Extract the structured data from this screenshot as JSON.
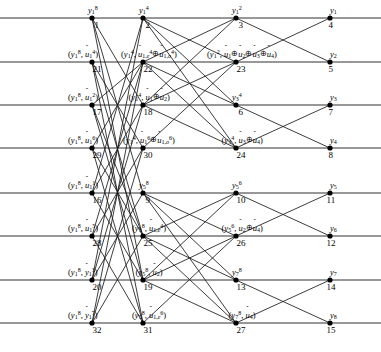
{
  "figure": {
    "kind": "polar-code decoding factor graph / butterfly trellis",
    "columns": 4,
    "rows": 8,
    "node_count": 32,
    "colors": {
      "line": "#1a1a1a",
      "node": "#000000",
      "background": "#ffffff"
    },
    "symbols": {
      "xor": "⊕",
      "hat": "ˆ"
    }
  },
  "layout": {
    "col_x": [
      92,
      143,
      236,
      330
    ],
    "row_y": [
      18,
      62,
      105,
      148,
      193,
      236,
      280,
      323
    ],
    "node_radius": 2.6
  },
  "nodes": [
    {
      "id": 1,
      "num": "1",
      "col": 0,
      "row": 0,
      "label_html": "<i>y</i><sub>1</sub><sup>8</sup>",
      "label_pos": "above",
      "label_text": "y_1^8"
    },
    {
      "id": 21,
      "num": "21",
      "col": 0,
      "row": 1,
      "label_html": "(<i>y</i><sub>1</sub><sup>8</sup>, <span class=\"hat\"><span class=\"h\">ˆ</span><i>u</i></span><sub>1</sub><sup>4</sup>)",
      "label_pos": "above",
      "label_text": "(y_1^8, û1^4)"
    },
    {
      "id": 17,
      "num": "17",
      "col": 0,
      "row": 2,
      "label_html": "(<i>y</i><sub>1</sub><sup>8</sup>, <span class=\"hat\"><span class=\"h\">ˆ</span><i>u</i></span><sub>1</sub><sup>2</sup>)",
      "label_pos": "above",
      "label_text": "(y_1^8, û1^2)"
    },
    {
      "id": 29,
      "num": "29",
      "col": 0,
      "row": 3,
      "label_html": "(<i>y</i><sub>1</sub><sup>8</sup>, <span class=\"hat\"><span class=\"h\">ˆ</span><i>u</i></span><sub>1</sub><sup>6</sup>)",
      "label_pos": "above",
      "label_text": "(y_1^8, û1^6)"
    },
    {
      "id": 16,
      "num": "16",
      "col": 0,
      "row": 4,
      "label_html": "(<i>y</i><sub>1</sub><sup>8</sup>, <span class=\"hat\"><span class=\"h\">ˆ</span><i>u</i></span><sub>1</sub><sup>1</sup>)",
      "label_pos": "above",
      "label_text": "(y_1^8, û1^1)"
    },
    {
      "id": 28,
      "num": "28",
      "col": 0,
      "row": 5,
      "label_html": "(<i>y</i><sub>1</sub><sup>8</sup>, <span class=\"hat\"><span class=\"h\">ˆ</span><i>u</i></span><sub>1</sub><sup>5</sup>)",
      "label_pos": "above",
      "label_text": "(y_1^8, û1^5)"
    },
    {
      "id": 20,
      "num": "20",
      "col": 0,
      "row": 6,
      "label_html": "(<i>y</i><sub>1</sub><sup>8</sup>, <span class=\"hat\"><span class=\"h\">ˆ</span><i>y</i></span><sub>1</sub><sup>3</sup>)",
      "label_pos": "above",
      "label_text": "(y_1^8, ŷ1^3)"
    },
    {
      "id": 32,
      "num": "32",
      "col": 0,
      "row": 7,
      "label_html": "(<i>y</i><sub>1</sub><sup>8</sup>, <span class=\"hat\"><span class=\"h\">ˆ</span><i>y</i></span><sub>1</sub><sup>7</sup>)",
      "label_pos": "above",
      "label_text": "(y_1^8, ŷ1^7)"
    },
    {
      "id": 2,
      "num": "2",
      "col": 1,
      "row": 0,
      "label_html": "<i>y</i><sub>1</sub><sup>4</sup>",
      "label_pos": "above",
      "label_text": "y_1^4"
    },
    {
      "id": 22,
      "num": "22",
      "col": 1,
      "row": 1,
      "label_html": "(<i>y</i><sub>1</sub><sup>4</sup>, <span class=\"hat\"><span class=\"h\">ˆ</span><i>u</i></span><sub>1,<i>e</i></sub><sup>4</sup><span class=\"xor\">⊕</span><span class=\"hat\"><span class=\"h\">ˆ</span><i>u</i></span><sub>1,<i>o</i></sub><sup>4</sup>)",
      "label_pos": "above",
      "label_text": "(y_1^4, û1,e^4 ⊕ û1,o^4)"
    },
    {
      "id": 18,
      "num": "18",
      "col": 1,
      "row": 2,
      "label_html": "(<i>y</i><sub>1</sub><sup>4</sup>, <span class=\"hat\"><span class=\"h\">ˆ</span><i>u</i></span><sub>1</sub><span class=\"xor\">⊕</span><span class=\"hat\"><span class=\"h\">ˆ</span><i>u</i></span><sub>2</sub>)",
      "label_pos": "above",
      "label_text": "(y_1^4, û1 ⊕ û2)"
    },
    {
      "id": 30,
      "num": "30",
      "col": 1,
      "row": 3,
      "label_html": "(<i>y</i><sub>1</sub><sup>4</sup>, <span class=\"hat\"><span class=\"h\">ˆ</span><i>u</i></span><sub>1</sub><sup>6</sup><span class=\"xor\">⊕</span><span class=\"hat\"><span class=\"h\">ˆ</span><i>u</i></span><sub>1,<i>o</i></sub><sup>6</sup>)",
      "label_pos": "above",
      "label_text": "(y_1^4, û1^6 ⊕ û1,o^6)"
    },
    {
      "id": 9,
      "num": "9",
      "col": 1,
      "row": 4,
      "label_html": "<i>y</i><sub>5</sub><sup>8</sup>",
      "label_pos": "above",
      "label_text": "y_5^8"
    },
    {
      "id": 25,
      "num": "25",
      "col": 1,
      "row": 5,
      "label_html": "(<i>y</i><sub>5</sub><sup>8</sup>, <span class=\"hat\"><span class=\"h\">ˆ</span><i>u</i></span><sub>1,<i>e</i></sub><sup>4</sup>)",
      "label_pos": "above",
      "label_text": "(y_5^8, û1,e^4)"
    },
    {
      "id": 19,
      "num": "19",
      "col": 1,
      "row": 6,
      "label_html": "(<i>y</i><sub>5</sub><sup>8</sup>, <span class=\"hat\"><span class=\"h\">ˆ</span><i>u</i></span><sub>2</sub>)",
      "label_pos": "above",
      "label_text": "(y_5^8, û2)"
    },
    {
      "id": 31,
      "num": "31",
      "col": 1,
      "row": 7,
      "label_html": "(<i>y</i><sub>5</sub><sup>8</sup>, <span class=\"hat\"><span class=\"h\">ˆ</span><i>u</i></span><sub>1,<i>e</i></sub><sup>6</sup>)",
      "label_pos": "above",
      "label_text": "(y_5^8, û1,e^6)"
    },
    {
      "id": 3,
      "num": "3",
      "col": 2,
      "row": 0,
      "label_html": "<i>y</i><sub>1</sub><sup>2</sup>",
      "label_pos": "above",
      "label_text": "y_1^2"
    },
    {
      "id": 23,
      "num": "23",
      "col": 2,
      "row": 1,
      "label_html": "(<i>y</i><sub>1</sub><sup>2</sup>, <span class=\"hat\"><span class=\"h\">ˆ</span><i>u</i></span><sub>1</sub><span class=\"xor\">⊕</span><span class=\"hat\"><span class=\"h\">ˆ</span><i>u</i></span><sub>2</sub><span class=\"xor\">⊕</span><span class=\"hat\"><span class=\"h\">ˆ</span><i>u</i></span><sub>3</sub><span class=\"xor\">⊕</span><span class=\"hat\"><span class=\"h\">ˆ</span><i>u</i></span><sub>4</sub>)",
      "label_pos": "above",
      "label_text": "(y_1^2, û1 ⊕ û2 ⊕ û3 ⊕ û4)"
    },
    {
      "id": 6,
      "num": "6",
      "col": 2,
      "row": 2,
      "label_html": "<i>y</i><sub>3</sub><sup>4</sup>",
      "label_pos": "above",
      "label_text": "y_3^4"
    },
    {
      "id": 24,
      "num": "24",
      "col": 2,
      "row": 3,
      "label_html": "(<i>y</i><sub>3</sub><sup>4</sup>, <span class=\"hat\"><span class=\"h\">ˆ</span><i>u</i></span><sub>3</sub><span class=\"xor\">⊕</span><span class=\"hat\"><span class=\"h\">ˆ</span><i>u</i></span><sub>4</sub>)",
      "label_pos": "above",
      "label_text": "(y_3^4, û3 ⊕ û4)"
    },
    {
      "id": 10,
      "num": "10",
      "col": 2,
      "row": 4,
      "label_html": "<i>y</i><sub>5</sub><sup>6</sup>",
      "label_pos": "above",
      "label_text": "y_5^6"
    },
    {
      "id": 26,
      "num": "26",
      "col": 2,
      "row": 5,
      "label_html": "(<i>y</i><sub>5</sub><sup>6</sup>, <span class=\"hat\"><span class=\"h\">ˆ</span><i>u</i></span><sub>2</sub><span class=\"xor\">⊕</span><span class=\"hat\"><span class=\"h\">ˆ</span><i>u</i></span><sub>4</sub>)",
      "label_pos": "above",
      "label_text": "(y_5^6, û2 ⊕ û4)"
    },
    {
      "id": 13,
      "num": "13",
      "col": 2,
      "row": 6,
      "label_html": "<i>y</i><sub>7</sub><sup>8</sup>",
      "label_pos": "above",
      "label_text": "y_7^8"
    },
    {
      "id": 27,
      "num": "27",
      "col": 2,
      "row": 7,
      "label_html": "(<i>y</i><sub>7</sub><sup>8</sup>, <span class=\"hat\"><span class=\"h\">ˆ</span><i>u</i></span><sub>4</sub>)",
      "label_pos": "above",
      "label_text": "(y_7^8, û4)"
    },
    {
      "id": 4,
      "num": "4",
      "col": 3,
      "row": 0,
      "label_html": "<i>y</i><sub>1</sub>",
      "label_pos": "above",
      "label_text": "y_1"
    },
    {
      "id": 5,
      "num": "5",
      "col": 3,
      "row": 1,
      "label_html": "<i>y</i><sub>2</sub>",
      "label_pos": "above",
      "label_text": "y_2"
    },
    {
      "id": 7,
      "num": "7",
      "col": 3,
      "row": 2,
      "label_html": "<i>y</i><sub>3</sub>",
      "label_pos": "above",
      "label_text": "y_3"
    },
    {
      "id": 8,
      "num": "8",
      "col": 3,
      "row": 3,
      "label_html": "<i>y</i><sub>4</sub>",
      "label_pos": "above",
      "label_text": "y_4"
    },
    {
      "id": 11,
      "num": "11",
      "col": 3,
      "row": 4,
      "label_html": "<i>y</i><sub>5</sub>",
      "label_pos": "above",
      "label_text": "y_5"
    },
    {
      "id": 12,
      "num": "12",
      "col": 3,
      "row": 5,
      "label_html": "<i>y</i><sub>6</sub>",
      "label_pos": "above",
      "label_text": "y_6"
    },
    {
      "id": 14,
      "num": "14",
      "col": 3,
      "row": 6,
      "label_html": "<i>y</i><sub>7</sub>",
      "label_pos": "above",
      "label_text": "y_7"
    },
    {
      "id": 15,
      "num": "15",
      "col": 3,
      "row": 7,
      "label_html": "<i>y</i><sub>8</sub>",
      "label_pos": "above",
      "label_text": "y_8"
    }
  ],
  "edges": [
    {
      "from": 1,
      "to": 2
    },
    {
      "from": 1,
      "to": 18
    },
    {
      "from": 1,
      "to": 9
    },
    {
      "from": 1,
      "to": 19
    },
    {
      "from": 21,
      "to": 22
    },
    {
      "from": 21,
      "to": 30
    },
    {
      "from": 21,
      "to": 25
    },
    {
      "from": 21,
      "to": 31
    },
    {
      "from": 17,
      "to": 18
    },
    {
      "from": 17,
      "to": 22
    },
    {
      "from": 17,
      "to": 19
    },
    {
      "from": 17,
      "to": 25
    },
    {
      "from": 29,
      "to": 30
    },
    {
      "from": 29,
      "to": 22
    },
    {
      "from": 29,
      "to": 31
    },
    {
      "from": 29,
      "to": 25
    },
    {
      "from": 16,
      "to": 2
    },
    {
      "from": 16,
      "to": 18
    },
    {
      "from": 16,
      "to": 9
    },
    {
      "from": 16,
      "to": 19
    },
    {
      "from": 28,
      "to": 22
    },
    {
      "from": 28,
      "to": 30
    },
    {
      "from": 28,
      "to": 25
    },
    {
      "from": 28,
      "to": 31
    },
    {
      "from": 20,
      "to": 18
    },
    {
      "from": 20,
      "to": 9
    },
    {
      "from": 20,
      "to": 2
    },
    {
      "from": 20,
      "to": 19
    },
    {
      "from": 32,
      "to": 30
    },
    {
      "from": 32,
      "to": 31
    },
    {
      "from": 32,
      "to": 22
    },
    {
      "from": 32,
      "to": 25
    },
    {
      "from": 2,
      "to": 3
    },
    {
      "from": 2,
      "to": 6
    },
    {
      "from": 2,
      "to": 23
    },
    {
      "from": 2,
      "to": 24
    },
    {
      "from": 22,
      "to": 23
    },
    {
      "from": 22,
      "to": 24
    },
    {
      "from": 22,
      "to": 3
    },
    {
      "from": 22,
      "to": 6
    },
    {
      "from": 18,
      "to": 3
    },
    {
      "from": 18,
      "to": 6
    },
    {
      "from": 18,
      "to": 23
    },
    {
      "from": 18,
      "to": 24
    },
    {
      "from": 30,
      "to": 23
    },
    {
      "from": 30,
      "to": 24
    },
    {
      "from": 9,
      "to": 10
    },
    {
      "from": 9,
      "to": 13
    },
    {
      "from": 9,
      "to": 26
    },
    {
      "from": 9,
      "to": 27
    },
    {
      "from": 25,
      "to": 26
    },
    {
      "from": 25,
      "to": 27
    },
    {
      "from": 25,
      "to": 10
    },
    {
      "from": 25,
      "to": 13
    },
    {
      "from": 19,
      "to": 10
    },
    {
      "from": 19,
      "to": 13
    },
    {
      "from": 19,
      "to": 26
    },
    {
      "from": 19,
      "to": 27
    },
    {
      "from": 31,
      "to": 26
    },
    {
      "from": 31,
      "to": 27
    },
    {
      "from": 3,
      "to": 4
    },
    {
      "from": 3,
      "to": 5
    },
    {
      "from": 23,
      "to": 4
    },
    {
      "from": 23,
      "to": 5
    },
    {
      "from": 6,
      "to": 7
    },
    {
      "from": 6,
      "to": 8
    },
    {
      "from": 24,
      "to": 7
    },
    {
      "from": 24,
      "to": 8
    },
    {
      "from": 10,
      "to": 11
    },
    {
      "from": 10,
      "to": 12
    },
    {
      "from": 26,
      "to": 11
    },
    {
      "from": 26,
      "to": 12
    },
    {
      "from": 13,
      "to": 14
    },
    {
      "from": 13,
      "to": 15
    },
    {
      "from": 27,
      "to": 14
    },
    {
      "from": 27,
      "to": 15
    }
  ],
  "rails": [
    {
      "row": 0,
      "x1": 0,
      "x2": 381
    },
    {
      "row": 1,
      "x1": 0,
      "x2": 381
    },
    {
      "row": 2,
      "x1": 0,
      "x2": 381
    },
    {
      "row": 3,
      "x1": 0,
      "x2": 381
    },
    {
      "row": 4,
      "x1": 0,
      "x2": 381
    },
    {
      "row": 5,
      "x1": 0,
      "x2": 381
    },
    {
      "row": 6,
      "x1": 0,
      "x2": 381
    },
    {
      "row": 7,
      "x1": 0,
      "x2": 381
    }
  ]
}
